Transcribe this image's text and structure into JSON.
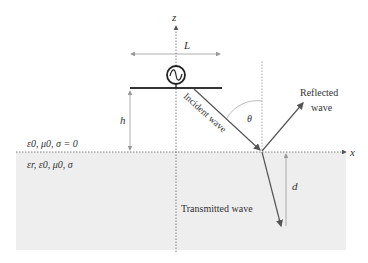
{
  "diagram": {
    "axes": {
      "z_label": "z",
      "x_label": "x"
    },
    "dimensions": {
      "width_label": "L",
      "height_label": "h",
      "depth_label": "d",
      "angle_label": "θ"
    },
    "media": {
      "upper": "ε0, μ0, σ = 0",
      "lower": "εr, ε0, μ0, σ"
    },
    "waves": {
      "incident": "Incident wave",
      "reflected_line1": "Reflected",
      "reflected_line2": "wave",
      "transmitted": "Transmitted wave"
    },
    "source": "ac-source",
    "colors": {
      "ground": "#eeeeee",
      "line": "#555555",
      "arrow_light": "#999999",
      "ink": "#333333"
    }
  }
}
